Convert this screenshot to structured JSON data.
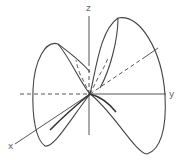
{
  "diagram": {
    "type": "3d-space-curve",
    "axes": [
      {
        "name": "x",
        "label": "x"
      },
      {
        "name": "y",
        "label": "y"
      },
      {
        "name": "z",
        "label": "z"
      }
    ],
    "colors": {
      "background": "#ffffff",
      "curve": "#444444",
      "axis": "#555555",
      "label": "#666666"
    }
  }
}
